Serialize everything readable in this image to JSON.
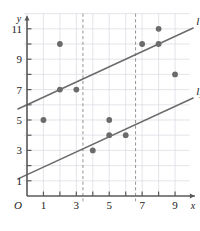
{
  "figure": {
    "origin_label": "O",
    "x_axis_label": "x",
    "y_axis_label": "y"
  },
  "chart_data": {
    "type": "scatter",
    "title": "",
    "xlabel": "x",
    "ylabel": "y",
    "xlim": [
      0,
      10
    ],
    "ylim": [
      0,
      12
    ],
    "grid": true,
    "legend": "none",
    "x_ticks": [
      1,
      2,
      3,
      4,
      5,
      6,
      7,
      8,
      9
    ],
    "x_tick_labels": [
      "1",
      "",
      "3",
      "",
      "5",
      "",
      "7",
      "",
      "9"
    ],
    "y_ticks": [
      1,
      2,
      3,
      4,
      5,
      6,
      7,
      8,
      9,
      10,
      11
    ],
    "y_tick_labels": [
      "1",
      "",
      "3",
      "",
      "5",
      "",
      "7",
      "",
      "9",
      "",
      "11"
    ],
    "points": [
      {
        "x": 1,
        "y": 5
      },
      {
        "x": 2,
        "y": 10
      },
      {
        "x": 2,
        "y": 7
      },
      {
        "x": 3,
        "y": 7
      },
      {
        "x": 4,
        "y": 3
      },
      {
        "x": 5,
        "y": 5
      },
      {
        "x": 5,
        "y": 4
      },
      {
        "x": 6,
        "y": 4
      },
      {
        "x": 7,
        "y": 10
      },
      {
        "x": 8,
        "y": 11
      },
      {
        "x": 8,
        "y": 10
      },
      {
        "x": 9,
        "y": 8
      }
    ],
    "point_color": "#6b6b6b",
    "lines": [
      {
        "name": "l1",
        "label": "l",
        "subscript": "1",
        "intercept": 6.0,
        "slope": 0.5,
        "x_start": -0.55,
        "x_end": 10.1,
        "color": "#6b6b6b",
        "style": "solid"
      },
      {
        "name": "l2",
        "label": "l",
        "subscript": "2",
        "intercept": 1.4,
        "slope": 0.5,
        "x_start": -0.55,
        "x_end": 10.1,
        "color": "#6b6b6b",
        "style": "solid"
      }
    ],
    "vertical_dashed_lines": [
      {
        "x": 3.4,
        "color": "#8a8a8a",
        "style": "dashed"
      },
      {
        "x": 6.6,
        "color": "#8a8a8a",
        "style": "dashed"
      }
    ],
    "grid_color": "#d9d9e2",
    "axis_color": "#5a5a5a"
  }
}
